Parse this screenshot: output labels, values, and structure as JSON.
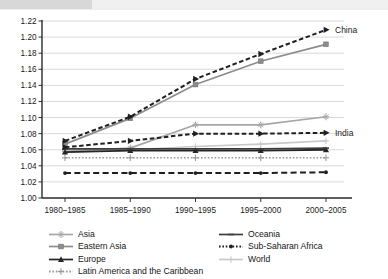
{
  "chart_data": {
    "type": "line",
    "title": "",
    "subtitle": "",
    "xlabel": "",
    "ylabel": "",
    "ylim": [
      1.0,
      1.22
    ],
    "ytick_step": 0.02,
    "yticks": [
      "1.00",
      "1.02",
      "1.04",
      "1.06",
      "1.08",
      "1.10",
      "1.12",
      "1.14",
      "1.16",
      "1.18",
      "1.20",
      "1.22"
    ],
    "grid": true,
    "grid_axis": "y",
    "legend_position": "bottom",
    "legend_columns": 2,
    "categories": [
      "1980–1985",
      "1985–1990",
      "1990–1995",
      "1995–2000",
      "2000–2005"
    ],
    "series": [
      {
        "name": "China",
        "values": [
          1.071,
          1.101,
          1.148,
          1.179,
          1.209
        ],
        "style": "dashed",
        "color": "#1f1f1f",
        "marker": "triangle-right",
        "annotation": "China"
      },
      {
        "name": "Eastern Asia",
        "values": [
          1.067,
          1.099,
          1.141,
          1.17,
          1.191
        ],
        "style": "solid",
        "color": "#8c8c8c",
        "marker": "square"
      },
      {
        "name": "India",
        "values": [
          1.063,
          1.071,
          1.08,
          1.08,
          1.081
        ],
        "style": "dashed",
        "color": "#1f1f1f",
        "marker": "triangle-right",
        "annotation": "India"
      },
      {
        "name": "Asia",
        "values": [
          1.058,
          1.062,
          1.091,
          1.091,
          1.101
        ],
        "style": "solid",
        "color": "#a6a6a6",
        "marker": "star"
      },
      {
        "name": "World",
        "values": [
          1.057,
          1.06,
          1.064,
          1.067,
          1.071
        ],
        "style": "solid",
        "color": "#c9c9c9",
        "marker": "plus"
      },
      {
        "name": "Oceania",
        "values": [
          1.061,
          1.061,
          1.061,
          1.061,
          1.062
        ],
        "style": "solid",
        "color": "#3d3d3d",
        "marker": "dash"
      },
      {
        "name": "Europe",
        "values": [
          1.057,
          1.059,
          1.059,
          1.059,
          1.06
        ],
        "style": "solid",
        "color": "#262626",
        "marker": "triangle-up"
      },
      {
        "name": "Latin America and the Caribbean",
        "values": [
          1.05,
          1.05,
          1.05,
          1.05,
          1.05
        ],
        "style": "dotted",
        "color": "#9a9a9a",
        "marker": "plus"
      },
      {
        "name": "Sub-Saharan Africa",
        "values": [
          1.031,
          1.031,
          1.031,
          1.031,
          1.032
        ],
        "style": "dashed-long",
        "color": "#1f1f1f",
        "marker": "dot"
      }
    ],
    "annotations": [
      {
        "text": "China",
        "series": "China",
        "at_category": "2000–2005"
      },
      {
        "text": "India",
        "series": "India",
        "at_category": "2000–2005"
      }
    ]
  },
  "axis": {
    "y_ticks": [
      "1.22",
      "1.20",
      "1.18",
      "1.16",
      "1.14",
      "1.12",
      "1.10",
      "1.08",
      "1.06",
      "1.04",
      "1.02",
      "1.00"
    ],
    "x_ticks": [
      "1980–1985",
      "1985–1990",
      "1990–1995",
      "1995–2000",
      "2000–2005"
    ]
  },
  "legend": {
    "left_column": [
      {
        "label": "Asia",
        "color": "#a6a6a6",
        "marker": "star",
        "style": "solid"
      },
      {
        "label": "Eastern Asia",
        "color": "#8c8c8c",
        "marker": "square",
        "style": "solid"
      },
      {
        "label": "Europe",
        "color": "#262626",
        "marker": "triangle-up",
        "style": "solid"
      },
      {
        "label": "Latin America and the Caribbean",
        "color": "#9a9a9a",
        "marker": "plus",
        "style": "dotted"
      }
    ],
    "right_column": [
      {
        "label": "Oceania",
        "color": "#3d3d3d",
        "marker": "dash",
        "style": "solid"
      },
      {
        "label": "Sub-Saharan Africa",
        "color": "#1f1f1f",
        "marker": "dot",
        "style": "dotted"
      },
      {
        "label": "World",
        "color": "#c9c9c9",
        "marker": "plus",
        "style": "solid"
      }
    ]
  },
  "annotations": {
    "china": "China",
    "india": "India"
  }
}
